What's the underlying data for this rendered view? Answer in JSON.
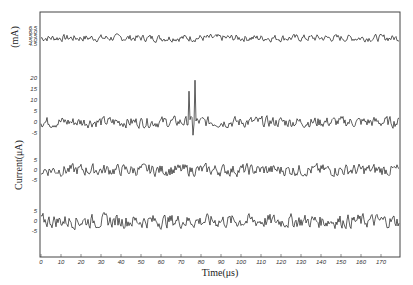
{
  "chart_data": {
    "type": "line",
    "title": "",
    "xlabel": "Time(μs)",
    "ylabel": "Current(μA)",
    "top_panel_ylabel": "(mA)",
    "xlim": [
      0,
      178
    ],
    "xticks": [
      0,
      10,
      20,
      30,
      40,
      50,
      60,
      70,
      80,
      90,
      100,
      110,
      120,
      130,
      140,
      150,
      160,
      170
    ],
    "grid": false,
    "legend": null,
    "panels": [
      {
        "name": "top-mA-trace",
        "unit": "mA",
        "yticks": [
          "6.5",
          "6.0",
          "5.5",
          "5.0",
          "4.5"
        ],
        "baseline": 5.3,
        "noise_amplitude": 0.45,
        "spikes": []
      },
      {
        "name": "trace-2",
        "unit": "μA",
        "yticks": [
          "20",
          "15",
          "10",
          "5",
          "0",
          "-5"
        ],
        "baseline": 0,
        "noise_amplitude": 2.5,
        "spikes": [
          {
            "x": 74,
            "y": 14
          },
          {
            "x": 77,
            "y": 19
          },
          {
            "x": 76,
            "y": -6
          }
        ]
      },
      {
        "name": "trace-3",
        "unit": "μA",
        "yticks": [
          "5",
          "0",
          "-5"
        ],
        "baseline": 0,
        "noise_amplitude": 3,
        "spikes": []
      },
      {
        "name": "trace-4",
        "unit": "μA",
        "yticks": [
          "5",
          "0",
          "-5"
        ],
        "baseline": 0,
        "noise_amplitude": 3.5,
        "spikes": []
      }
    ]
  }
}
